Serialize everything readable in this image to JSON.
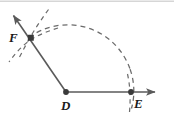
{
  "figure": {
    "width": 174,
    "height": 125,
    "background_color": "#ffffff",
    "top_rule_color": "#d6d6d6",
    "line_color": "#5a5a5a",
    "dash_color": "#6b6b6b",
    "point_color": "#3a3a3a",
    "label_color": "#1a1a1a"
  },
  "points": [
    {
      "id": "F",
      "label": "F",
      "x": 31,
      "y": 38,
      "label_x": 9,
      "label_y": 31,
      "marker": "square-dot"
    },
    {
      "id": "D",
      "label": "D",
      "x": 66,
      "y": 92,
      "label_x": 61,
      "label_y": 99,
      "marker": "round-dot"
    },
    {
      "id": "E",
      "label": "E",
      "x": 131,
      "y": 92,
      "label_x": 134,
      "label_y": 97,
      "marker": "round-dot"
    }
  ],
  "rays": [
    {
      "name": "ray-DF",
      "from": "D",
      "through": "F",
      "start_x": 66,
      "start_y": 92,
      "end_x": 12,
      "end_y": 13,
      "arrowhead": "end"
    },
    {
      "name": "ray-DE",
      "from": "D",
      "through": "E",
      "start_x": 66,
      "start_y": 92,
      "end_x": 159,
      "end_y": 92,
      "arrowhead": "end"
    }
  ],
  "arcs": [
    {
      "name": "main-compass-arc",
      "center": "D",
      "center_x": 66,
      "center_y": 92,
      "radius": 66,
      "start_angle_deg": 124,
      "end_angle_deg": -14,
      "style": "dashed",
      "passes_through": [
        "F",
        "E"
      ]
    },
    {
      "name": "construction-arc-1",
      "center": "E",
      "center_x": 131,
      "center_y": 92,
      "radius": 103,
      "start_angle_deg": 150,
      "end_angle_deg": 196,
      "style": "dashed"
    },
    {
      "name": "construction-arc-2",
      "center_x": 53,
      "center_y": 10,
      "radius": 42,
      "start_angle_deg": 60,
      "end_angle_deg": 140,
      "style": "dashed"
    }
  ],
  "labels": {
    "F": "F",
    "D": "D",
    "E": "E"
  }
}
